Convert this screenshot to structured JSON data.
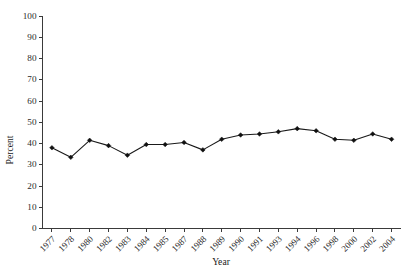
{
  "chart_data": {
    "type": "line",
    "title": "",
    "xlabel": "Year",
    "ylabel": "Percent",
    "categories": [
      "1977",
      "1978",
      "1980",
      "1982",
      "1983",
      "1984",
      "1985",
      "1987",
      "1988",
      "1989",
      "1990",
      "1991",
      "1993",
      "1994",
      "1996",
      "1998",
      "2000",
      "2002",
      "2004"
    ],
    "values": [
      38.0,
      33.5,
      41.5,
      39.0,
      34.5,
      39.5,
      39.5,
      40.5,
      37.0,
      42.0,
      44.0,
      44.5,
      45.5,
      47.0,
      46.0,
      42.0,
      41.5,
      44.5,
      42.0
    ],
    "series": [
      {
        "name": "Percent",
        "values": [
          38.0,
          33.5,
          41.5,
          39.0,
          34.5,
          39.5,
          39.5,
          40.5,
          37.0,
          42.0,
          44.0,
          44.5,
          45.5,
          47.0,
          46.0,
          42.0,
          41.5,
          44.5,
          42.0
        ]
      }
    ],
    "ylim": [
      0,
      100
    ],
    "ytick_labels": [
      "0",
      "10",
      "20",
      "30",
      "40",
      "50",
      "60",
      "70",
      "80",
      "90",
      "100"
    ],
    "ytick_values": [
      0,
      10,
      20,
      30,
      40,
      50,
      60,
      70,
      80,
      90,
      100
    ],
    "grid": false,
    "legend": false,
    "legend_position": "none",
    "marker": "diamond",
    "line_color": "#1a1a1a",
    "marker_color": "#101010",
    "axis_color": "#3a3a3a",
    "background_color": "#ffffff",
    "xtick_label_rotation": 45
  }
}
